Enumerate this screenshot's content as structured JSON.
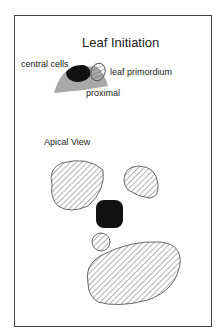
{
  "title": "Leaf Initiation",
  "side_view": {
    "labels": {
      "central_cells": "central cells",
      "leaf_primordium": "leaf primordium",
      "proximal": "proximal"
    }
  },
  "apical_view": {
    "label": "Apical View"
  },
  "colors": {
    "meristem_fill": "#a8a8a8",
    "central_cells_fill": "#111111",
    "hatch_stroke": "#555555",
    "border": "#444444"
  }
}
